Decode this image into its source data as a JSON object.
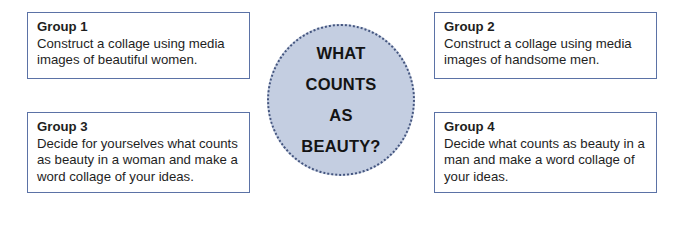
{
  "center": {
    "lines": [
      "WHAT",
      "COUNTS",
      "AS",
      "BEAUTY?"
    ]
  },
  "groups": [
    {
      "title": "Group 1",
      "text": "Construct a collage using media images of beautiful women."
    },
    {
      "title": "Group 2",
      "text": "Construct a collage using media images of handsome men."
    },
    {
      "title": "Group 3",
      "text": "Decide for yourselves what counts as beauty in a woman and make a word collage of your ideas."
    },
    {
      "title": "Group 4",
      "text": "Decide what counts as beauty in a man and make a word collage of your ideas."
    }
  ],
  "colors": {
    "box_border": "#5b72a6",
    "circle_fill": "#c4cee1",
    "circle_dots": "#44557f"
  }
}
